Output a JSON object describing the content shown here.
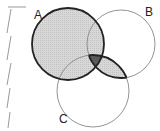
{
  "diagram": {
    "type": "venn",
    "sets": [
      {
        "label": "A",
        "cx": 68,
        "cy": 44,
        "r": 36,
        "stroke_weight": "bold"
      },
      {
        "label": "B",
        "cx": 121,
        "cy": 44,
        "r": 34,
        "stroke_weight": "thin"
      },
      {
        "label": "C",
        "cx": 93,
        "cy": 91,
        "r": 36,
        "stroke_weight": "thin"
      }
    ],
    "shaded_regions": [
      "A",
      "B∩C"
    ],
    "dark_region": "A∩B∩C",
    "colors": {
      "light_shade": "#d4d4d4",
      "dark_shade": "#5a5a5a",
      "stroke": "#222222",
      "thin_stroke": "#888888"
    }
  }
}
